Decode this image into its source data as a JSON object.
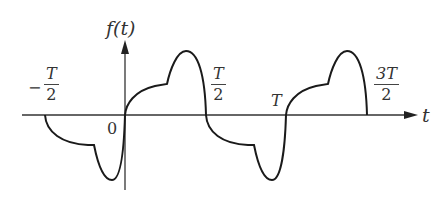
{
  "figure": {
    "type": "waveform-diagram",
    "y_axis_label": "f(t)",
    "x_axis_label": "t",
    "origin_label": "0",
    "tick_labels": [
      {
        "sign": "−",
        "numerator": "T",
        "denominator": "2",
        "value": "-T/2"
      },
      {
        "sign": "",
        "numerator": "T",
        "denominator": "2",
        "value": "T/2"
      },
      {
        "sign": "",
        "numerator": "T",
        "denominator": "",
        "value": "T"
      },
      {
        "sign": "",
        "numerator": "3T",
        "denominator": "2",
        "value": "3T/2"
      }
    ],
    "colors": {
      "curve": "#1a1a1a",
      "axis": "#333333",
      "background": "#ffffff"
    }
  }
}
